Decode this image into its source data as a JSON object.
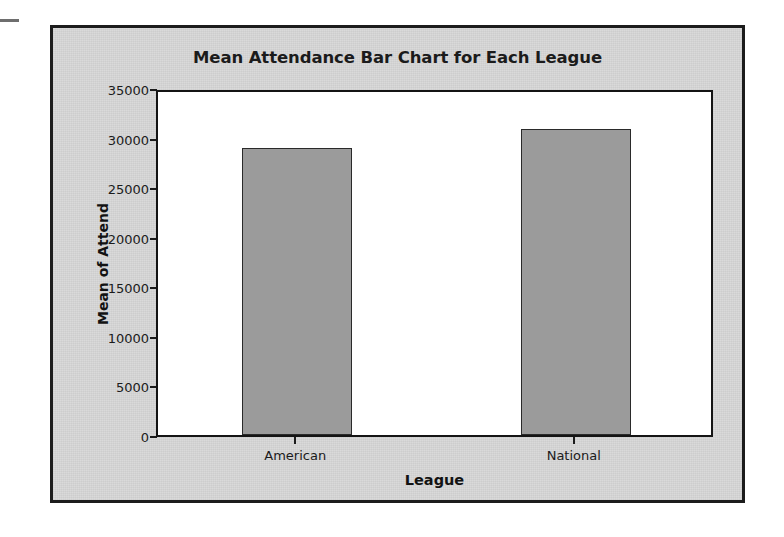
{
  "chart_data": {
    "type": "bar",
    "title": "Mean Attendance Bar Chart for Each League",
    "xlabel": "League",
    "ylabel": "Mean of Attend",
    "categories": [
      "American",
      "National"
    ],
    "values": [
      28950,
      30870
    ],
    "ylim": [
      0,
      35000
    ],
    "yticks": [
      0,
      5000,
      10000,
      15000,
      20000,
      25000,
      30000,
      35000
    ],
    "ytick_labels": [
      "0",
      "5000",
      "10000",
      "15000",
      "20000",
      "25000",
      "30000",
      "35000"
    ],
    "grid": false,
    "legend": null,
    "bar_color": "#9b9b9b",
    "bar_edge_color": "#2a2a2a",
    "plot_background": "#ffffff",
    "panel_background": "#d8d8d8",
    "frame_color": "#1c1c1c",
    "text_color": "#1b1b1b"
  }
}
